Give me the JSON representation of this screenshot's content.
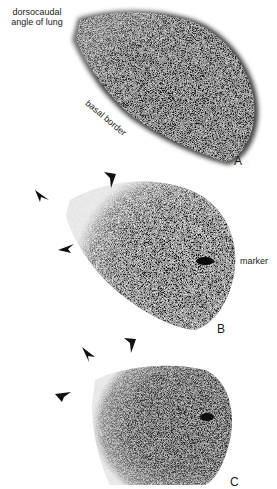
{
  "figure": {
    "panels": [
      {
        "id": "A",
        "letter": "A",
        "annotations": {
          "dorsocaudal_line1": "dorsocaudal",
          "dorsocaudal_line2": "angle of lung",
          "basal_border": "basal border"
        }
      },
      {
        "id": "B",
        "letter": "B",
        "annotations": {
          "marker": "marker"
        },
        "arrowheads": 3
      },
      {
        "id": "C",
        "letter": "C",
        "arrowheads": 3
      }
    ],
    "colors": {
      "background": "#ffffff",
      "scan_dark": "#1a1a1a",
      "text": "#1a1a1a"
    }
  }
}
